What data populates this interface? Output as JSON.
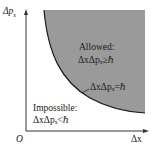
{
  "diagram": {
    "axes": {
      "y_label": "Δp",
      "y_label_sub": "x",
      "x_label": "Δx",
      "origin_label": "O"
    },
    "regions": {
      "allowed": {
        "title": "Allowed:",
        "relation": "ΔxΔpₓ≥ℏ"
      },
      "impossible": {
        "title": "Impossible:",
        "relation": "ΔxΔpₓ<ℏ"
      }
    },
    "curve_label": "ΔxΔpₓ=ℏ",
    "colors": {
      "shaded_region": "#9a9a9a",
      "curve": "#1a1a1a",
      "axes": "#333333",
      "background": "#ffffff"
    }
  }
}
